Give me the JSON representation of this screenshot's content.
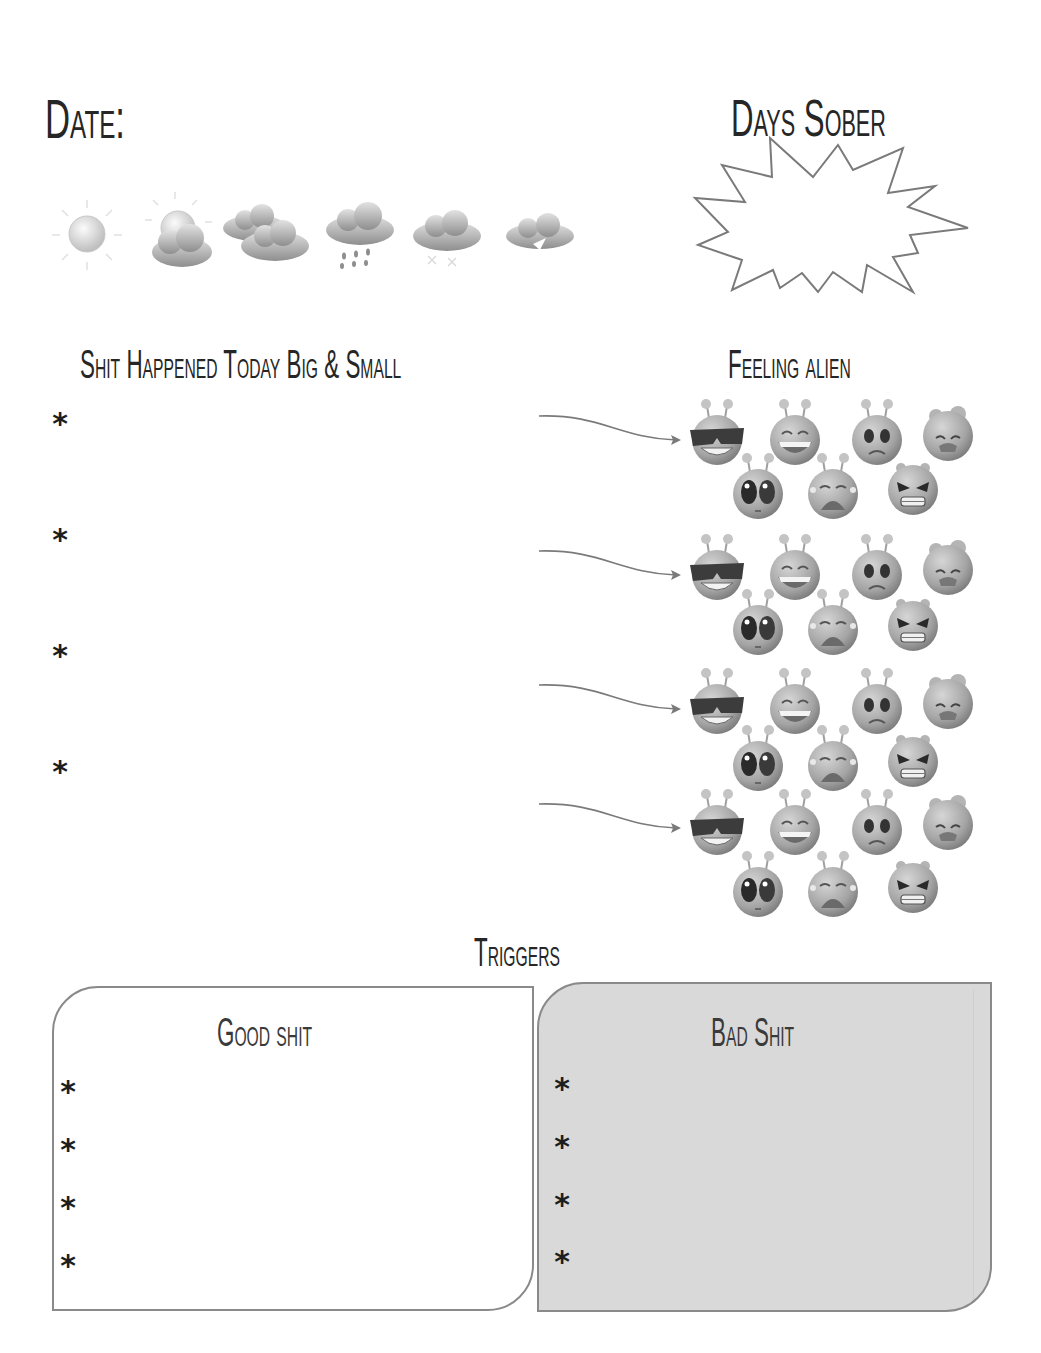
{
  "header": {
    "date_label": "Date:",
    "days_sober_label": "Days Sober",
    "days_sober_value": ""
  },
  "weather": {
    "options": [
      {
        "name": "sunny",
        "icon": "sun-icon"
      },
      {
        "name": "partly-cloudy",
        "icon": "sun-behind-cloud-icon"
      },
      {
        "name": "cloudy",
        "icon": "clouds-icon"
      },
      {
        "name": "rain",
        "icon": "rain-cloud-icon"
      },
      {
        "name": "snow",
        "icon": "snow-cloud-icon"
      },
      {
        "name": "thunderstorm",
        "icon": "lightning-cloud-icon"
      }
    ]
  },
  "events": {
    "title": "Shit Happened Today Big & Small",
    "bullet": "*",
    "entries": [
      "",
      "",
      "",
      ""
    ]
  },
  "feelings": {
    "title": "Feeling alien",
    "moods": [
      "cool",
      "laughing",
      "worried",
      "sick",
      "shocked",
      "crying",
      "angry"
    ]
  },
  "triggers": {
    "title": "Triggers",
    "good": {
      "title": "Good shit",
      "bullet": "*",
      "items": [
        "",
        "",
        "",
        ""
      ]
    },
    "bad": {
      "title": "Bad Shit",
      "bullet": "*",
      "items": [
        "",
        "",
        "",
        ""
      ]
    }
  },
  "colors": {
    "ink": "#262626",
    "outline": "#8a8a8a",
    "bad_fill": "#d9d9d9",
    "alien_fill": "#a8a8a8"
  }
}
